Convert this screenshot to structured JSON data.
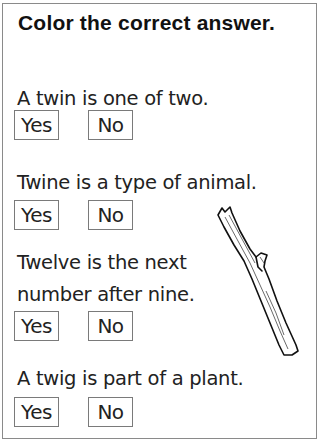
{
  "worksheet": {
    "title": "Color the correct answer.",
    "questions": [
      {
        "text_lines": [
          "A twin is one of two."
        ],
        "options": [
          "Yes",
          "No"
        ]
      },
      {
        "text_lines": [
          "Twine is a type of animal."
        ],
        "options": [
          "Yes",
          "No"
        ]
      },
      {
        "text_lines": [
          "Twelve is the next",
          "number after nine."
        ],
        "options": [
          "Yes",
          "No"
        ]
      },
      {
        "text_lines": [
          "A twig is part of a plant."
        ],
        "options": [
          "Yes",
          "No"
        ]
      }
    ],
    "illustration": "twig-illustration"
  }
}
